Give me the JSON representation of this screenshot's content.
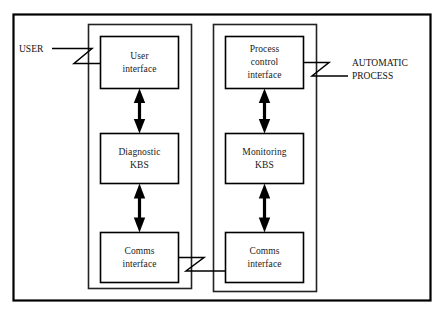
{
  "diagram": {
    "background_color": "#ffffff",
    "line_color": "#000000",
    "text_color": "#1a1a1a",
    "outer_frame": {
      "name": "system-boundary"
    },
    "subsystems": [
      {
        "id": "diagnostic-subsystem",
        "name": "left-subsystem-container",
        "nodes": [
          {
            "id": "user-interface",
            "lines": [
              "User",
              "interface"
            ]
          },
          {
            "id": "diagnostic-kbs",
            "lines": [
              "Diagnostic",
              "KBS"
            ]
          },
          {
            "id": "comms-interface-left",
            "lines": [
              "Comms",
              "interface"
            ]
          }
        ]
      },
      {
        "id": "monitoring-subsystem",
        "name": "right-subsystem-container",
        "nodes": [
          {
            "id": "process-control-interface",
            "lines": [
              "Process",
              "control",
              "interface"
            ]
          },
          {
            "id": "monitoring-kbs",
            "lines": [
              "Monitoring",
              "KBS"
            ]
          },
          {
            "id": "comms-interface-right",
            "lines": [
              "Comms",
              "interface"
            ]
          }
        ]
      }
    ],
    "external_actors": [
      {
        "id": "user",
        "label": "USER",
        "side": "left"
      },
      {
        "id": "automatic-process",
        "label": "AUTOMATIC\nPROCESS",
        "side": "right"
      }
    ],
    "connections": [
      {
        "from": "user-interface",
        "to": "diagnostic-kbs",
        "type": "double-arrow"
      },
      {
        "from": "diagnostic-kbs",
        "to": "comms-interface-left",
        "type": "double-arrow"
      },
      {
        "from": "process-control-interface",
        "to": "monitoring-kbs",
        "type": "double-arrow"
      },
      {
        "from": "monitoring-kbs",
        "to": "comms-interface-right",
        "type": "double-arrow"
      },
      {
        "from": "comms-interface-left",
        "to": "comms-interface-right",
        "type": "zigzag-link"
      },
      {
        "from": "user",
        "to": "user-interface",
        "type": "zigzag-link"
      },
      {
        "from": "process-control-interface",
        "to": "automatic-process",
        "type": "zigzag-link"
      }
    ]
  }
}
